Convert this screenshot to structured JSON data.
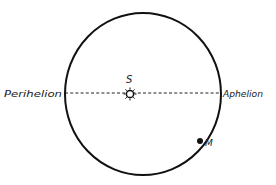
{
  "diagram": {
    "type": "orbit",
    "labels": {
      "perihelion": "Perihelion",
      "aphelion": "Aphelion",
      "sun": "S",
      "body": "M"
    },
    "colors": {
      "stroke": "#111111",
      "text": "#222222",
      "background": "#ffffff"
    },
    "geometry": {
      "orbit_center": [
        143,
        94
      ],
      "orbit_rx": 78,
      "orbit_ry": 81,
      "sun_position": [
        130,
        94
      ],
      "body_position": [
        200,
        141
      ],
      "apsis_line_y": 93
    }
  }
}
